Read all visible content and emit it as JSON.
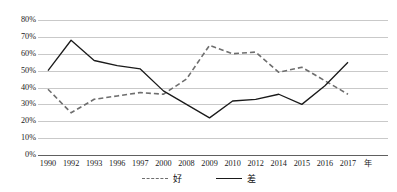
{
  "chart_data": {
    "type": "line",
    "title": "",
    "xlabel": "年",
    "ylabel": "",
    "ylim": [
      0,
      80
    ],
    "ytick_step": 10,
    "ytick_labels": [
      "80%",
      "70%",
      "60%",
      "50%",
      "40%",
      "30%",
      "20%",
      "10%",
      "0%"
    ],
    "grid": true,
    "legend_position": "bottom",
    "categories": [
      "1990",
      "1992",
      "1993",
      "1996",
      "1997",
      "2000",
      "2008",
      "2009",
      "2010",
      "2012",
      "2014",
      "2015",
      "2016",
      "2017"
    ],
    "series": [
      {
        "name": "好",
        "style": "dashed",
        "color": "#6e6e6e",
        "values": [
          39,
          25,
          33,
          35,
          37,
          36,
          45,
          65,
          60,
          61,
          49,
          52,
          44,
          36
        ]
      },
      {
        "name": "差",
        "style": "solid",
        "color": "#1a1a1a",
        "values": [
          50,
          68,
          56,
          53,
          51,
          38,
          30,
          22,
          32,
          33,
          36,
          30,
          41,
          55
        ]
      }
    ]
  },
  "legend": {
    "items": [
      {
        "label": "好",
        "style": "dashed"
      },
      {
        "label": "差",
        "style": "solid"
      }
    ]
  },
  "axis": {
    "x_unit_label": "年"
  }
}
